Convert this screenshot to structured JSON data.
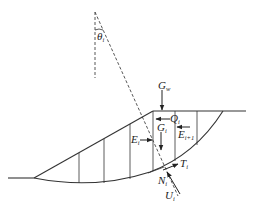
{
  "diagram": {
    "type": "slope-stability-slice-method",
    "colors": {
      "line": "#333333",
      "background": "#ffffff"
    },
    "angle_label": {
      "main": "θ",
      "sub": "i"
    },
    "forces": {
      "G_w": {
        "main": "G",
        "sub": "w"
      },
      "Q": {
        "main": "Q",
        "sub": "i"
      },
      "G": {
        "main": "G",
        "sub": "i"
      },
      "E_left": {
        "main": "E",
        "sub": "i"
      },
      "E_right": {
        "main": "E",
        "sub": "i+1"
      },
      "T": {
        "main": "T",
        "sub": "i"
      },
      "N": {
        "main": "N",
        "sub": "i"
      },
      "U": {
        "main": "U",
        "sub": "i"
      }
    },
    "slice_count": 7
  }
}
